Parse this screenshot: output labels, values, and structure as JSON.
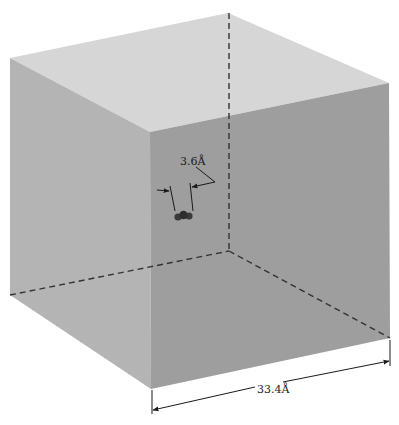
{
  "diagram": {
    "colors": {
      "background": "#ffffff",
      "face_top": "#d6d6d6",
      "face_left": "#b4b4b4",
      "face_right": "#9e9e9e",
      "edge_dashed": "#333333",
      "dimension_line": "#1a1a1a",
      "molecule": "#3a3a3a"
    },
    "labels": {
      "molecule_size": "3.6Å",
      "box_edge_length": "33.4Å"
    }
  }
}
